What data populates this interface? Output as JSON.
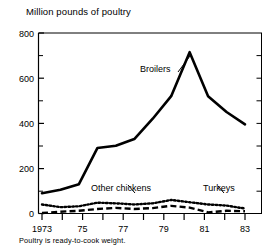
{
  "chart_data": {
    "type": "line",
    "title": "Million pounds of poultry",
    "xlabel": "",
    "ylabel": "Million pounds of poultry",
    "footnote": "Poultry is ready-to-cook weight.",
    "x": [
      1973,
      1974,
      1975,
      1976,
      1977,
      1978,
      1979,
      1980,
      1981,
      1982,
      1983,
      1984
    ],
    "xlim": [
      1973,
      1984
    ],
    "ylim": [
      0,
      800
    ],
    "yticks": [
      0,
      200,
      400,
      600,
      800
    ],
    "yminorticks": [
      100,
      300,
      500,
      700
    ],
    "ytick_labels": [
      "0",
      "200",
      "400",
      "600",
      "800"
    ],
    "xticks": [
      1973,
      1974,
      1975,
      1976,
      1977,
      1978,
      1979,
      1980,
      1981,
      1982,
      1983,
      1984
    ],
    "xtick_labels": [
      "1973",
      "",
      "75",
      "",
      "77",
      "",
      "79",
      "",
      "81",
      "",
      "83",
      ""
    ],
    "grid": false,
    "legend": "inline-annotations",
    "series": [
      {
        "name": "Broilers",
        "style": "solid",
        "values": [
          90,
          105,
          130,
          290,
          300,
          330,
          420,
          520,
          715,
          520,
          450,
          395
        ],
        "annotation": {
          "text": "Broilers",
          "x": 1978.4,
          "y": 600
        }
      },
      {
        "name": "Other chickens",
        "style": "dotted",
        "values": [
          40,
          28,
          32,
          48,
          45,
          40,
          45,
          60,
          50,
          40,
          35,
          22
        ],
        "annotation": {
          "text": "Other chickens",
          "x": 1976.3,
          "y": 118
        }
      },
      {
        "name": "Turkeys",
        "style": "dashed",
        "values": [
          2,
          8,
          12,
          20,
          25,
          20,
          24,
          34,
          26,
          5,
          12,
          10
        ],
        "annotation": {
          "text": "Turkeys",
          "x": 1981.8,
          "y": 118
        }
      }
    ],
    "colors": {
      "axis": "#000000",
      "broilers": "#000000",
      "other_chickens": "#000000",
      "turkeys": "#000000",
      "background": "#ffffff"
    }
  }
}
